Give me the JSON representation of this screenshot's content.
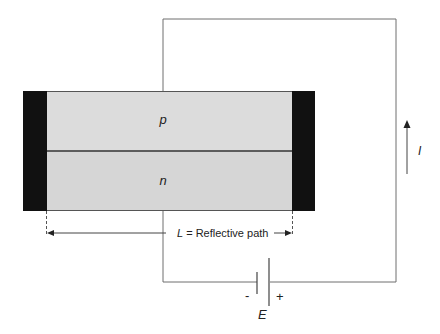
{
  "diagram": {
    "layers": {
      "p_label": "p",
      "n_label": "n"
    },
    "path_label": {
      "symbol": "L",
      "text": " = Reflective path"
    },
    "current_label": "I",
    "battery": {
      "minus": "-",
      "plus": "+",
      "emf_label": "E"
    },
    "colors": {
      "semiconductor": "#dcdcdc",
      "contacts": "#111111",
      "wire": "#6e6e6e",
      "junction_line": "#333333"
    }
  }
}
